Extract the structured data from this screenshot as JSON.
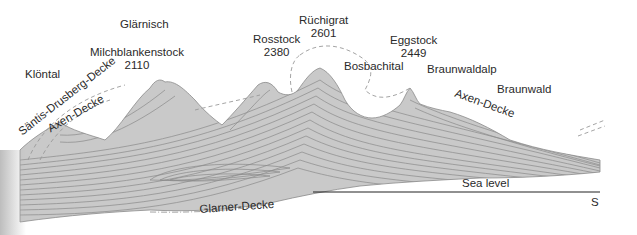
{
  "diagram": {
    "type": "geological-cross-section",
    "colors": {
      "rock_fill": "#c9c9c9",
      "strata_line": "#8a8a8a",
      "dash_line": "#9a9a9a",
      "sea_level_line": "#222222",
      "text": "#2a2a2a"
    },
    "peaks": [
      {
        "name": "Glärnisch",
        "elevation": null
      },
      {
        "name": "Milchblankenstock",
        "elevation": "2110"
      },
      {
        "name": "Rosstock",
        "elevation": "2380"
      },
      {
        "name": "Rüchigrat",
        "elevation": "2601"
      },
      {
        "name": "Eggstock",
        "elevation": "2449"
      }
    ],
    "places": {
      "klontal": "Klöntal",
      "bosbachital": "Bosbachital",
      "braunwaldalp": "Braunwaldalp",
      "braunwald": "Braunwald"
    },
    "nappes": {
      "santis_drusberg": "Säntis-Drusberg-Decke",
      "axen_left": "Axen-Decke",
      "axen_right": "Axen-Decke",
      "glarner": "Glarner-Decke"
    },
    "sea_level": "Sea level",
    "direction": "S"
  }
}
